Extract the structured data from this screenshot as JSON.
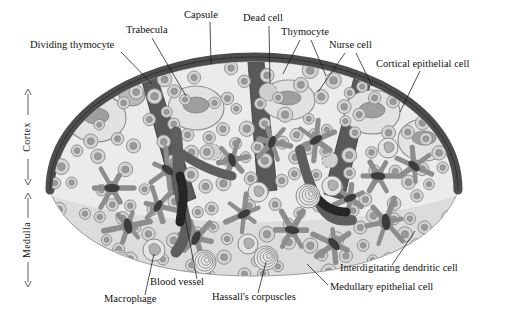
{
  "figure": {
    "background_color": "#ffffff"
  },
  "palette": {
    "capsule": "#4d4d4d",
    "trabecula": "#595959",
    "cortex_fill": "#e9e9e9",
    "medulla_fill": "#dcdcdc",
    "outline": "#8a8a8a",
    "thymocyte_fill": "#d2d2d2",
    "thymocyte_nucleus": "#9a9a9a",
    "nurse_cell_fill": "#dedede",
    "epithelial_cell": "#8d8d8d",
    "epithelial_nucleus": "#3c3c3c",
    "blood_vessel": "#5e5e5e",
    "blood_vessel_lumen": "#2b2b2b",
    "dead_cell": "#a8a8a8",
    "macrophage_inclusion": "#b5b5b5",
    "label_text": "#111111",
    "leader_line": "#1a1a1a"
  },
  "axis": {
    "regions": [
      {
        "id": "cortex",
        "label": "Cortex",
        "x": 28,
        "y_top": 88,
        "y_bottom": 186
      },
      {
        "id": "medulla",
        "label": "Medulla",
        "x": 28,
        "y_top": 192,
        "y_bottom": 288
      }
    ]
  },
  "labels": [
    {
      "id": "dividing-thymocyte",
      "text": "Dividing thymocyte",
      "x": 30,
      "y": 48,
      "anchor": "start",
      "leaders": [
        [
          [
            121,
            52
          ],
          [
            152,
            84
          ]
        ]
      ]
    },
    {
      "id": "trabecula",
      "text": "Trabecula",
      "x": 126,
      "y": 33,
      "anchor": "start",
      "leaders": [
        [
          [
            152,
            38
          ],
          [
            186,
            96
          ]
        ]
      ]
    },
    {
      "id": "capsule",
      "text": "Capsule",
      "x": 184,
      "y": 18,
      "anchor": "start",
      "leaders": [
        [
          [
            210,
            22
          ],
          [
            211,
            64
          ]
        ]
      ]
    },
    {
      "id": "dead-cell",
      "text": "Dead cell",
      "x": 243,
      "y": 21,
      "anchor": "start",
      "leaders": [
        [
          [
            269,
            26
          ],
          [
            270,
            84
          ]
        ]
      ]
    },
    {
      "id": "thymocyte",
      "text": "Thymocyte",
      "x": 281,
      "y": 35,
      "anchor": "start",
      "leaders": [
        [
          [
            300,
            40
          ],
          [
            283,
            74
          ]
        ],
        [
          [
            311,
            40
          ],
          [
            326,
            76
          ]
        ]
      ]
    },
    {
      "id": "nurse-cell",
      "text": "Nurse cell",
      "x": 329,
      "y": 48,
      "anchor": "start",
      "leaders": [
        [
          [
            345,
            53
          ],
          [
            318,
            92
          ]
        ],
        [
          [
            356,
            53
          ],
          [
            372,
            86
          ]
        ]
      ]
    },
    {
      "id": "cortical-epithelial-cell",
      "text": "Cortical epithelial cell",
      "x": 376,
      "y": 67,
      "anchor": "start",
      "leaders": [
        [
          [
            420,
            71
          ],
          [
            400,
            112
          ]
        ]
      ]
    },
    {
      "id": "interdigitating-dendritic-cell",
      "text": "Interdigitating dendritic cell",
      "x": 340,
      "y": 271,
      "anchor": "start",
      "leaders": [
        [
          [
            392,
            265
          ],
          [
            415,
            231
          ]
        ]
      ]
    },
    {
      "id": "medullary-epithelial-cell",
      "text": "Medullary epithelial cell",
      "x": 330,
      "y": 290,
      "anchor": "start",
      "leaders": [
        [
          [
            328,
            285
          ],
          [
            307,
            264
          ]
        ]
      ]
    },
    {
      "id": "hassalls-corpuscles",
      "text": "Hassall's corpuscles",
      "x": 212,
      "y": 300,
      "anchor": "start",
      "leaders": [
        [
          [
            258,
            293
          ],
          [
            266,
            262
          ]
        ]
      ]
    },
    {
      "id": "blood-vessel",
      "text": "Blood vessel",
      "x": 150,
      "y": 285,
      "anchor": "start",
      "leaders": [
        [
          [
            197,
            279
          ],
          [
            184,
            213
          ]
        ]
      ]
    },
    {
      "id": "macrophage",
      "text": "Macrophage",
      "x": 104,
      "y": 302,
      "anchor": "start",
      "leaders": [
        [
          [
            145,
            295
          ],
          [
            154,
            254
          ]
        ]
      ]
    }
  ]
}
